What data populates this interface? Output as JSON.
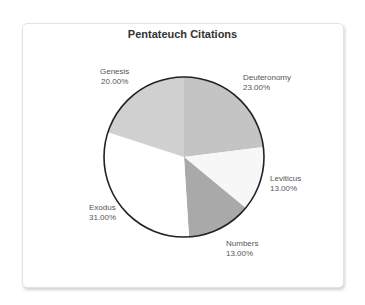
{
  "chart_data": {
    "type": "pie",
    "title": "Pentateuch Citations",
    "categories": [
      "Deuteronomy",
      "Leviticus",
      "Numbers",
      "Exodus",
      "Genesis"
    ],
    "values": [
      23,
      13,
      13,
      31,
      20
    ],
    "value_labels": [
      "23.00%",
      "13.00%",
      "13.00%",
      "31.00%",
      "20.00%"
    ],
    "colors": [
      "#c4c4c4",
      "#f7f7f7",
      "#a9a9a9",
      "#ffffff",
      "#d0d0d0"
    ],
    "start_angle": "12 o'clock",
    "direction": "clockwise",
    "legend": "none (slice labels outside pie)"
  },
  "labels": {
    "genesis": {
      "name": "Genesis",
      "pct": "20.00%"
    },
    "deuteronomy": {
      "name": "Deuteronomy",
      "pct": "23.00%"
    },
    "leviticus": {
      "name": "Leviticus",
      "pct": "13.00%"
    },
    "exodus": {
      "name": "Exodus",
      "pct": "31.00%"
    },
    "numbers": {
      "name": "Numbers",
      "pct": "13.00%"
    }
  }
}
